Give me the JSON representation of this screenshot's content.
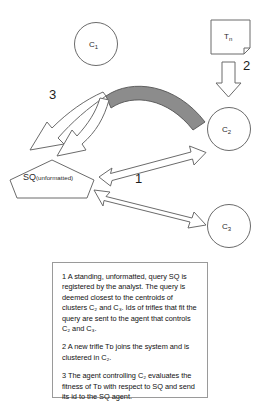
{
  "diagram": {
    "nodes": [
      {
        "id": "c1",
        "label": "C",
        "subscript": "1",
        "shape": "circle"
      },
      {
        "id": "c2",
        "label": "C",
        "subscript": "2",
        "shape": "circle"
      },
      {
        "id": "c3",
        "label": "C",
        "subscript": "3",
        "shape": "circle"
      },
      {
        "id": "tn",
        "label": "T",
        "subscript": "n",
        "shape": "document"
      }
    ],
    "query_node": {
      "name": "SQ",
      "qualifier": "(unformatted)",
      "shape": "pentagon"
    },
    "step_labels": [
      {
        "id": "step-1",
        "text": "1"
      },
      {
        "id": "step-2",
        "text": "2"
      },
      {
        "id": "step-3",
        "text": "3"
      }
    ],
    "colors": {
      "arc_fill": "#8c8c8c",
      "stroke": "#5a5a5a",
      "text": "#1a1a1a",
      "box_border": "#9a9a9a"
    }
  },
  "legend": {
    "paragraphs": [
      "1 A standing, unformatted, query SQ is registered by the analyst. The query is deemed closest to the centroids of clusters C₂ and C₃. Ids of trifles that fit the query are sent to the agent that controls C₂ and C₃.",
      "2 A new trifle Tᴅ joins the system and is clustered in C₂.",
      "3 The agent controlling C₂ evaluates the fitness of Tᴅ with respect to SQ and send its id to the SQ agent."
    ]
  }
}
